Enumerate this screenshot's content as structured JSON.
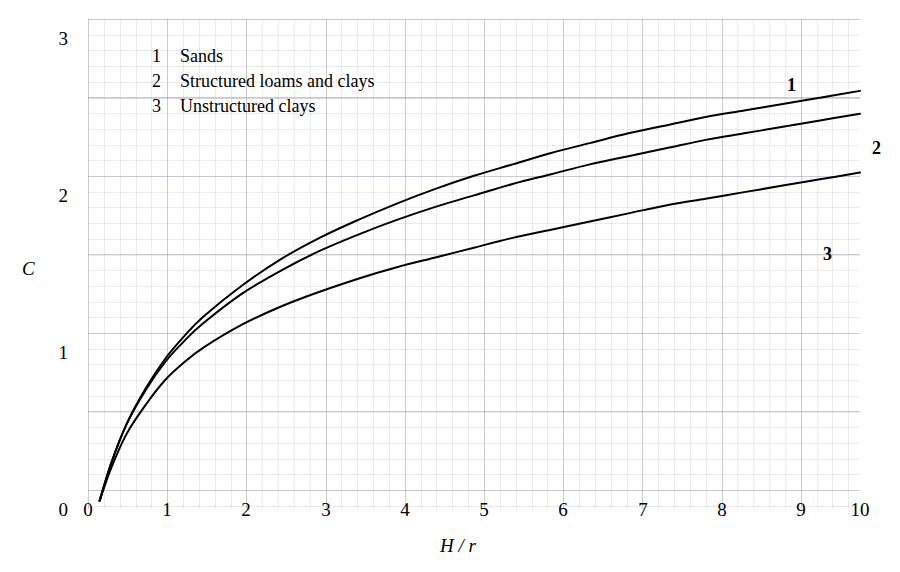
{
  "chart_data": {
    "type": "line",
    "title": "",
    "subtitle": "",
    "xlabel": "H / r",
    "ylabel": "C",
    "xlim": [
      0,
      10
    ],
    "ylim": [
      0,
      3
    ],
    "xticks": [
      "0",
      "1",
      "2",
      "3",
      "4",
      "5",
      "6",
      "7",
      "8",
      "9",
      "10"
    ],
    "yticks": [
      "0",
      "1",
      "2",
      "3"
    ],
    "grid": true,
    "grid_style": "graph-paper, minor gridlines 0.2 units, major gridlines 1 unit",
    "legend_position": "inside-upper-left",
    "annotations": [
      {
        "text": "1",
        "x": 9.0,
        "y": 2.73,
        "bold": true
      },
      {
        "text": "2",
        "x": 10.2,
        "y": 2.32,
        "bold": true
      },
      {
        "text": "3",
        "x": 9.5,
        "y": 1.63,
        "bold": true
      }
    ],
    "legend_entries": [
      {
        "key": "1",
        "label": "Sands"
      },
      {
        "key": "2",
        "label": "Structured loams and clays"
      },
      {
        "key": "3",
        "label": "Unstructured clays"
      }
    ],
    "series": [
      {
        "name": "Sands",
        "key": "1",
        "color": "#000000",
        "x": [
          0.15,
          0.3,
          0.5,
          0.75,
          1.0,
          1.25,
          1.5,
          2.0,
          2.5,
          3.0,
          3.5,
          4.0,
          4.5,
          5.0,
          5.5,
          6.0,
          6.5,
          7.0,
          7.5,
          8.0,
          8.5,
          9.0,
          9.5,
          10.0
        ],
        "y": [
          0.05,
          0.28,
          0.52,
          0.74,
          0.92,
          1.06,
          1.18,
          1.37,
          1.53,
          1.66,
          1.77,
          1.87,
          1.96,
          2.04,
          2.11,
          2.18,
          2.24,
          2.3,
          2.35,
          2.4,
          2.44,
          2.48,
          2.52,
          2.56
        ]
      },
      {
        "name": "Structured loams and clays",
        "key": "2",
        "color": "#000000",
        "x": [
          0.15,
          0.3,
          0.5,
          0.75,
          1.0,
          1.25,
          1.5,
          2.0,
          2.5,
          3.0,
          3.5,
          4.0,
          4.5,
          5.0,
          5.5,
          6.0,
          6.5,
          7.0,
          7.5,
          8.0,
          8.5,
          9.0,
          9.5,
          10.0
        ],
        "y": [
          0.05,
          0.28,
          0.52,
          0.73,
          0.9,
          1.03,
          1.14,
          1.32,
          1.46,
          1.58,
          1.68,
          1.77,
          1.85,
          1.92,
          1.99,
          2.05,
          2.11,
          2.16,
          2.21,
          2.26,
          2.3,
          2.34,
          2.38,
          2.42
        ]
      },
      {
        "name": "Unstructured clays",
        "key": "3",
        "color": "#000000",
        "x": [
          0.15,
          0.3,
          0.5,
          0.75,
          1.0,
          1.25,
          1.5,
          2.0,
          2.5,
          3.0,
          3.5,
          4.0,
          4.5,
          5.0,
          5.5,
          6.0,
          6.5,
          7.0,
          7.5,
          8.0,
          8.5,
          9.0,
          9.5,
          10.0
        ],
        "y": [
          0.05,
          0.25,
          0.46,
          0.64,
          0.79,
          0.9,
          0.99,
          1.13,
          1.24,
          1.33,
          1.41,
          1.48,
          1.54,
          1.6,
          1.66,
          1.71,
          1.76,
          1.81,
          1.86,
          1.9,
          1.94,
          1.98,
          2.02,
          2.06
        ]
      }
    ]
  },
  "axes": {
    "x_title": "H / r",
    "y_title": "C",
    "x_tick_labels": [
      "0",
      "1",
      "2",
      "3",
      "4",
      "5",
      "6",
      "7",
      "8",
      "9",
      "10"
    ],
    "y_tick_labels": [
      "3",
      "2",
      "1",
      "0"
    ]
  },
  "legend": {
    "rows": [
      {
        "key": "1",
        "text": "Sands"
      },
      {
        "key": "2",
        "text": "Structured loams and clays"
      },
      {
        "key": "3",
        "text": "Unstructured clays"
      }
    ]
  },
  "curve_labels": {
    "one": "1",
    "two": "2",
    "three": "3"
  },
  "colors": {
    "curve": "#000000",
    "grid_major": "#9696a5",
    "grid_minor": "#aaaab9",
    "text": "#000000",
    "background": "#ffffff"
  }
}
